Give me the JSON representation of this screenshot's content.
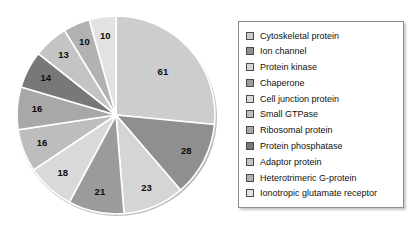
{
  "chart_data": {
    "type": "pie",
    "title": "",
    "subtitle": "",
    "xlabel": "",
    "ylabel": "",
    "total": 220,
    "start_angle_deg": 0,
    "direction": "clockwise",
    "legend_position": "right",
    "grid": false,
    "categories": [
      "Cytoskeletal protein",
      "Ion channel",
      "Protein kinase",
      "Chaperone",
      "Cell junction protein",
      "Small GTPase",
      "Ribosomal protein",
      "Protein phosphatase",
      "Adaptor protein",
      "Heterotrimeric G-protein",
      "Ionotropic glutamate receptor"
    ],
    "values": [
      61,
      28,
      23,
      21,
      18,
      16,
      16,
      14,
      13,
      10,
      10
    ],
    "colors": [
      "#cdcdcd",
      "#8f8f8f",
      "#d5d5d5",
      "#9b9b9b",
      "#d9d9d9",
      "#bdbdbd",
      "#a8a8a8",
      "#787878",
      "#c4c4c4",
      "#b2b2b2",
      "#e2e2e2"
    ],
    "data_labels": [
      "61",
      "28",
      "23",
      "21",
      "18",
      "16",
      "16",
      "14",
      "13",
      "10",
      "10"
    ]
  },
  "legend": {
    "items": [
      {
        "label": "Cytoskeletal protein",
        "color": "#cdcdcd"
      },
      {
        "label": "Ion channel",
        "color": "#8f8f8f"
      },
      {
        "label": "Protein kinase",
        "color": "#d5d5d5"
      },
      {
        "label": "Chaperone",
        "color": "#9b9b9b"
      },
      {
        "label": "Cell junction protein",
        "color": "#d9d9d9"
      },
      {
        "label": "Small GTPase",
        "color": "#bdbdbd"
      },
      {
        "label": "Ribosomal protein",
        "color": "#a8a8a8"
      },
      {
        "label": "Protein phosphatase",
        "color": "#787878"
      },
      {
        "label": "Adaptor protein",
        "color": "#c4c4c4"
      },
      {
        "label": "Heterotrimeric G-protein",
        "color": "#b2b2b2"
      },
      {
        "label": "Ionotropic glutamate receptor",
        "color": "#e2e2e2"
      }
    ]
  }
}
